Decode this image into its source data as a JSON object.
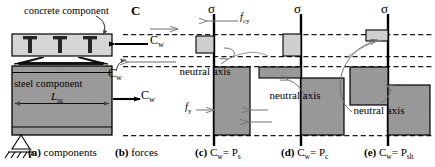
{
  "figure": {
    "width": 435,
    "height": 167,
    "background": "#ffffff"
  },
  "panel_a": {
    "caption_letter": "(a)",
    "caption_text": "components",
    "concrete_label": "concrete component",
    "steel_label": "steel component",
    "length_symbol": "L",
    "length_subscript": "ss",
    "stud_count": 3,
    "support": "pin-support",
    "concrete_fill": "#d4d4d4",
    "steel_fill": "#9a9a9a",
    "stud_fill": "#2b2b2b"
  },
  "panel_b": {
    "caption_letter": "(b)",
    "caption_text": "forces",
    "resultant_label": "C",
    "force_symbol": "C",
    "force_subscript": "w",
    "arrow_top_direction": "left",
    "arrow_bottom_direction": "right",
    "force_label_count": 3
  },
  "panel_c": {
    "caption_letter": "(c)",
    "caption_text": "C",
    "caption_sub": "w",
    "caption_eq": "= P",
    "caption_eq_sub": "s",
    "axis_label": "σ",
    "stress_concrete": "f",
    "stress_concrete_sub": "cy",
    "stress_steel": "f",
    "stress_steel_sub": "y",
    "neutral_axis_label": "neutral axis",
    "compression_block": "small-light-left",
    "tension_block": "large-dark-right"
  },
  "panel_d": {
    "caption_letter": "(d)",
    "caption_text": "C",
    "caption_sub": "w",
    "caption_eq": "= P",
    "caption_eq_sub": "c",
    "axis_label": "σ",
    "neutral_axis_label": "neutral axis",
    "compression_block": "small-light-left",
    "steel_strip": "thin-dark-left",
    "tension_block": "large-dark-right"
  },
  "panel_e": {
    "caption_letter": "(e)",
    "caption_text": "C",
    "caption_sub": "w",
    "caption_eq": "= P",
    "caption_eq_sub": "sh",
    "axis_label": "σ",
    "neutral_axis_label": "neutral axis",
    "compression_block": "small-light-left",
    "steel_block_left": "medium-dark-left",
    "tension_block": "large-dark-right"
  },
  "colors": {
    "line": "#000000",
    "dashed": "#1a1a1a",
    "light_block": "#cdcdcd",
    "dark_block": "#8f8f8f",
    "thin_arrow": "#6d6d6d"
  }
}
